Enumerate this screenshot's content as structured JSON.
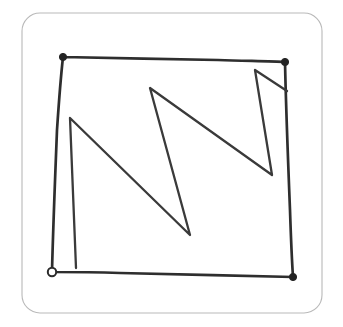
{
  "canvas": {
    "width": 343,
    "height": 327,
    "background_color": "#ffffff",
    "title": "Hand-drawn square with zigzag stroke"
  },
  "frame": {
    "name": "rounded-frame",
    "x": 22,
    "y": 13,
    "width": 300,
    "height": 300,
    "corner_radius": 18,
    "stroke_color": "#b9b9b9",
    "stroke_width": 1.1
  },
  "ink": {
    "color": "#2e2e2e",
    "stroke_width": 2.7,
    "style": "hand-drawn pencil"
  },
  "shapes": [
    {
      "name": "sketched-square-outline",
      "type": "closed-polyline",
      "label": "Square border",
      "points": "63,57 150,59 220,60 285,62 288,140 291,210 293,277 200,275 120,273 52,272 55,200 59,130 63,57",
      "path": "M63,57 C110,58 170,59 218,60 C248,61 272,61 285,62 C286,110 288,160 290,210 C291,240 292,262 293,277 C240,276 170,274 120,273 C90,272 68,272 52,272 C53,230 55,180 57,130 C59,100 61,75 63,57"
    },
    {
      "name": "zigzag-gesture-stroke",
      "type": "open-polyline",
      "label": "Zigzag N/W stroke",
      "points": "76,268 70,118 190,235 150,88 272,175 255,70 287,91",
      "path": "M76,268 L70,118 L190,235 L150,88 L272,175 L255,70 L287,91"
    }
  ],
  "markers": [
    {
      "name": "start-point-marker",
      "type": "hollow-circle",
      "cx": 52,
      "cy": 272,
      "r": 4.2,
      "fill": "#ffffff",
      "stroke": "#2b2b2b",
      "meaning": "stroke start"
    },
    {
      "name": "corner-node-top-left",
      "type": "filled-dot",
      "cx": 63,
      "cy": 57,
      "r": 3.6,
      "fill": "#232323"
    },
    {
      "name": "corner-node-top-right",
      "type": "filled-dot",
      "cx": 285,
      "cy": 62,
      "r": 3.6,
      "fill": "#232323"
    },
    {
      "name": "corner-node-bottom-right",
      "type": "filled-dot",
      "cx": 293,
      "cy": 277,
      "r": 3.6,
      "fill": "#232323"
    }
  ]
}
